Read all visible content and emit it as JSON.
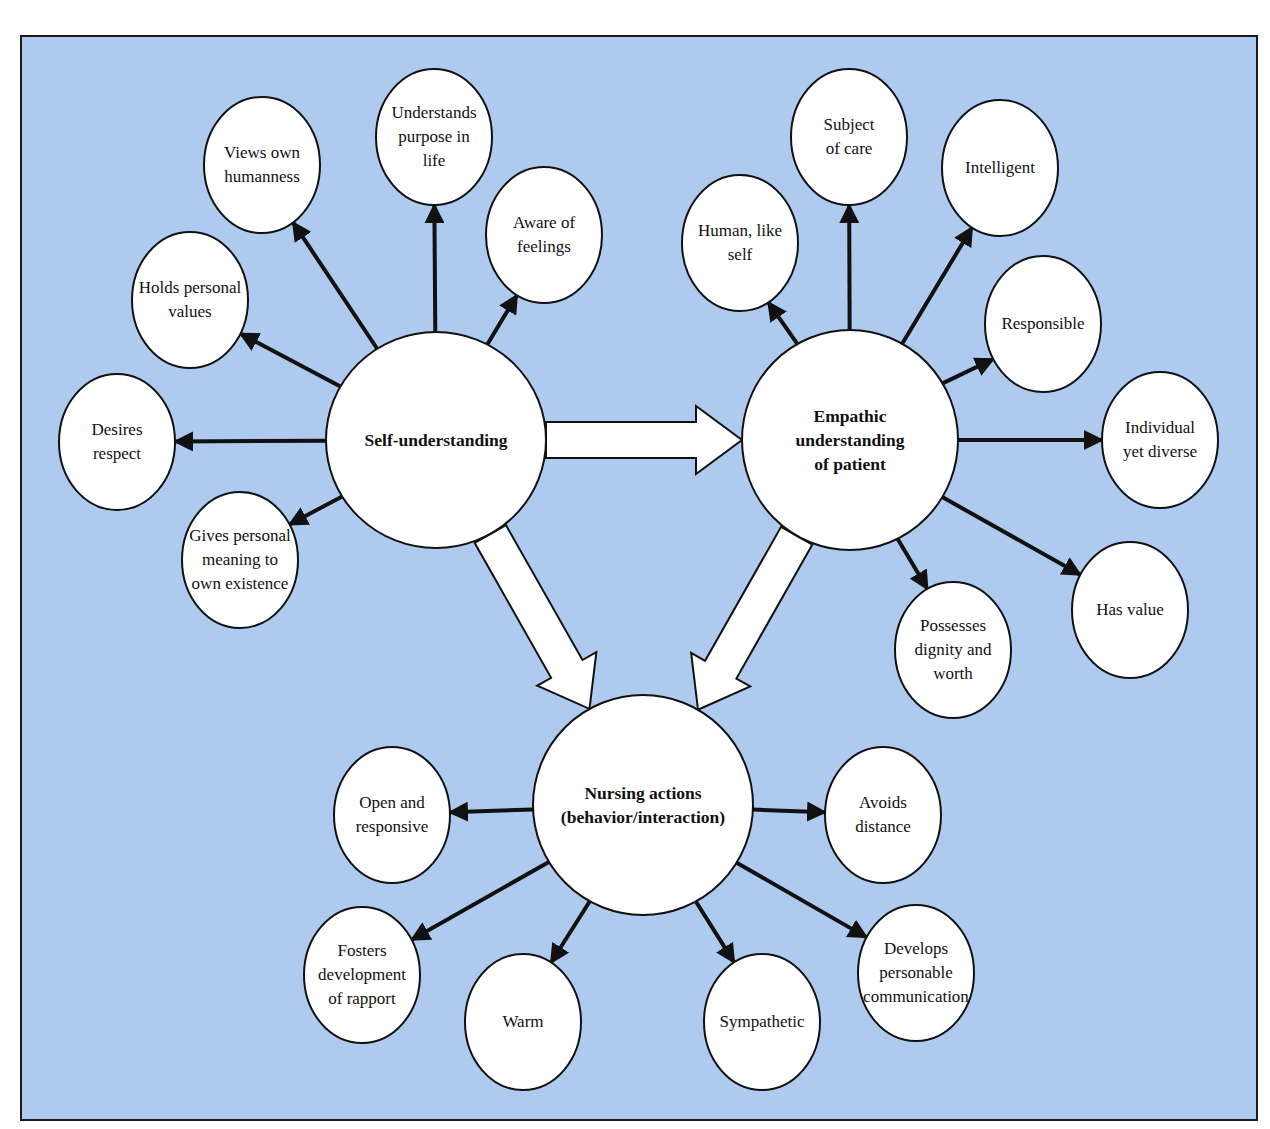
{
  "diagram": {
    "background_color": "#aecbef",
    "hubs": [
      {
        "id": "self",
        "label": "Self-understanding",
        "cx": 436,
        "cy": 440,
        "rx": 110,
        "ry": 108
      },
      {
        "id": "empathic",
        "label": "Empathic\nunderstanding\nof patient",
        "cx": 850,
        "cy": 440,
        "rx": 108,
        "ry": 110
      },
      {
        "id": "nursing",
        "label": "Nursing actions\n(behavior/interaction)",
        "cx": 643,
        "cy": 805,
        "rx": 110,
        "ry": 110
      }
    ],
    "nodes": [
      {
        "id": "views-own-humanness",
        "parent": "self",
        "label": "Views own\nhumanness",
        "cx": 262,
        "cy": 165,
        "rx": 58,
        "ry": 68
      },
      {
        "id": "understands-purpose",
        "parent": "self",
        "label": "Understands\npurpose in\nlife",
        "cx": 434,
        "cy": 137,
        "rx": 58,
        "ry": 68
      },
      {
        "id": "aware-of-feelings",
        "parent": "self",
        "label": "Aware of\nfeelings",
        "cx": 544,
        "cy": 235,
        "rx": 58,
        "ry": 68
      },
      {
        "id": "holds-personal-values",
        "parent": "self",
        "label": "Holds personal\nvalues",
        "cx": 190,
        "cy": 300,
        "rx": 58,
        "ry": 68
      },
      {
        "id": "desires-respect",
        "parent": "self",
        "label": "Desires\nrespect",
        "cx": 117,
        "cy": 442,
        "rx": 58,
        "ry": 68
      },
      {
        "id": "gives-personal-meaning",
        "parent": "self",
        "label": "Gives personal\nmeaning to\nown existence",
        "cx": 240,
        "cy": 560,
        "rx": 58,
        "ry": 68
      },
      {
        "id": "subject-of-care",
        "parent": "empathic",
        "label": "Subject\nof care",
        "cx": 849,
        "cy": 137,
        "rx": 58,
        "ry": 68
      },
      {
        "id": "human-like-self",
        "parent": "empathic",
        "label": "Human, like\nself",
        "cx": 740,
        "cy": 243,
        "rx": 58,
        "ry": 68
      },
      {
        "id": "intelligent",
        "parent": "empathic",
        "label": "Intelligent",
        "cx": 1000,
        "cy": 168,
        "rx": 58,
        "ry": 68
      },
      {
        "id": "responsible",
        "parent": "empathic",
        "label": "Responsible",
        "cx": 1043,
        "cy": 324,
        "rx": 58,
        "ry": 68
      },
      {
        "id": "individual-yet-diverse",
        "parent": "empathic",
        "label": "Individual\nyet diverse",
        "cx": 1160,
        "cy": 440,
        "rx": 58,
        "ry": 68
      },
      {
        "id": "possesses-dignity",
        "parent": "empathic",
        "label": "Possesses\ndignity and\nworth",
        "cx": 953,
        "cy": 650,
        "rx": 58,
        "ry": 68
      },
      {
        "id": "has-value",
        "parent": "empathic",
        "label": "Has value",
        "cx": 1130,
        "cy": 610,
        "rx": 58,
        "ry": 68
      },
      {
        "id": "open-and-responsive",
        "parent": "nursing",
        "label": "Open and\nresponsive",
        "cx": 392,
        "cy": 815,
        "rx": 58,
        "ry": 68
      },
      {
        "id": "avoids-distance",
        "parent": "nursing",
        "label": "Avoids\ndistance",
        "cx": 883,
        "cy": 815,
        "rx": 58,
        "ry": 68
      },
      {
        "id": "fosters-rapport",
        "parent": "nursing",
        "label": "Fosters\ndevelopment\nof rapport",
        "cx": 362,
        "cy": 975,
        "rx": 58,
        "ry": 68
      },
      {
        "id": "warm",
        "parent": "nursing",
        "label": "Warm",
        "cx": 523,
        "cy": 1022,
        "rx": 58,
        "ry": 68
      },
      {
        "id": "sympathetic",
        "parent": "nursing",
        "label": "Sympathetic",
        "cx": 762,
        "cy": 1022,
        "rx": 58,
        "ry": 68
      },
      {
        "id": "develops-communication",
        "parent": "nursing",
        "label": "Develops\npersonable\ncommunication",
        "cx": 916,
        "cy": 973,
        "rx": 58,
        "ry": 68
      }
    ],
    "flows": [
      {
        "from": "self",
        "to": "empathic"
      },
      {
        "from": "self",
        "to": "nursing"
      },
      {
        "from": "empathic",
        "to": "nursing"
      }
    ]
  }
}
